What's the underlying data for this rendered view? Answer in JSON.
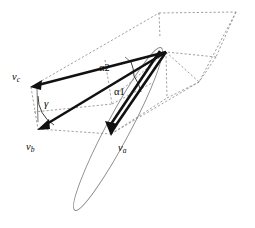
{
  "figure": {
    "type": "vector-geometry-diagram",
    "background_color": "#ffffff",
    "width": 255,
    "height": 228,
    "apex": {
      "x": 166,
      "y": 52,
      "name": "common-origin-vertex"
    },
    "vectors": [
      {
        "id": "va",
        "label_main": "v",
        "label_sub": "a",
        "from": {
          "x": 166,
          "y": 52
        },
        "to": {
          "x": 111,
          "y": 134
        },
        "color": "#111111",
        "label_pos": {
          "x": 118,
          "y": 143
        }
      },
      {
        "id": "vb",
        "label_main": "v",
        "label_sub": "b",
        "from": {
          "x": 166,
          "y": 52
        },
        "to": {
          "x": 38,
          "y": 129
        },
        "color": "#111111",
        "label_pos": {
          "x": 26,
          "y": 142
        }
      },
      {
        "id": "vc",
        "label_main": "v",
        "label_sub": "c",
        "from": {
          "x": 166,
          "y": 52
        },
        "to": {
          "x": 31,
          "y": 87
        },
        "color": "#111111",
        "label_pos": {
          "x": 12,
          "y": 72
        }
      }
    ],
    "angles": [
      {
        "id": "alpha1",
        "label": "α1",
        "pos": {
          "x": 114,
          "y": 87
        },
        "description": "angle-between-va-and-reference"
      },
      {
        "id": "alpha2",
        "label": "α2",
        "pos": {
          "x": 99,
          "y": 63
        },
        "description": "angle-between-vc-and-reference"
      },
      {
        "id": "gamma",
        "label": "γ",
        "pos": {
          "x": 44,
          "y": 98
        },
        "description": "angle-at-vb-arrowhead"
      }
    ],
    "ellipse": {
      "id": "slender-ellipse",
      "center": {
        "x": 118,
        "y": 129
      },
      "rx": 12,
      "ry": 92,
      "rotation_deg": 28,
      "stroke": "#8a8a8a"
    },
    "parallelepiped": {
      "id": "dashed-bounding-box",
      "stroke": "#8e8e8e",
      "style": "dashed",
      "vertices": {
        "A": {
          "x": 31,
          "y": 87
        },
        "B": {
          "x": 159,
          "y": 13
        },
        "C": {
          "x": 236,
          "y": 12
        },
        "D": {
          "x": 216,
          "y": 57
        },
        "E": {
          "x": 166,
          "y": 52
        },
        "F": {
          "x": 38,
          "y": 129
        },
        "G": {
          "x": 111,
          "y": 134
        },
        "H": {
          "x": 167,
          "y": 98
        },
        "I": {
          "x": 199,
          "y": 82
        }
      }
    }
  }
}
